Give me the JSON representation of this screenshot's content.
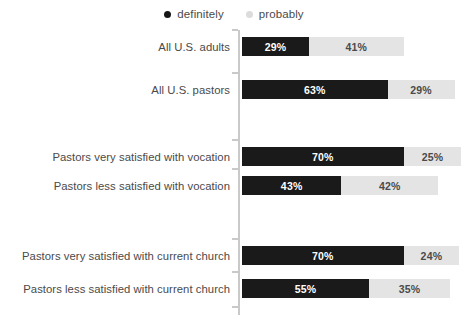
{
  "chart_data": {
    "type": "bar",
    "title": "",
    "subtitle": "",
    "xlabel": "",
    "ylabel": "",
    "orientation": "horizontal",
    "stacked": true,
    "grid": false,
    "legend_position": "top-center",
    "xlim": [
      0,
      100
    ],
    "value_suffix": "%",
    "categories": [
      "All U.S. adults",
      "All U.S. pastors",
      "Pastors very satisfied with vocation",
      "Pastors less satisfied with vocation",
      "Pastors very satisfied with current church",
      "Pastors less satisfied with current church"
    ],
    "groups": [
      [
        0,
        1
      ],
      [
        2,
        3
      ],
      [
        4,
        5
      ]
    ],
    "series": [
      {
        "name": "definitely",
        "color": "#1a1a1a",
        "values": [
          29,
          63,
          70,
          43,
          70,
          55
        ]
      },
      {
        "name": "probably",
        "color": "#e4e4e4",
        "values": [
          41,
          29,
          25,
          42,
          24,
          35
        ]
      }
    ],
    "labels": [
      {
        "definitely": "29%",
        "probably": "41%"
      },
      {
        "definitely": "63%",
        "probably": "29%"
      },
      {
        "definitely": "70%",
        "probably": "25%"
      },
      {
        "definitely": "43%",
        "probably": "42%"
      },
      {
        "definitely": "70%",
        "probably": "24%"
      },
      {
        "definitely": "55%",
        "probably": "35%"
      }
    ]
  },
  "legend": {
    "items": [
      {
        "label": "definitely",
        "color": "#1a1a1a",
        "key": "definitely"
      },
      {
        "label": "probably",
        "color": "#dcdcdc",
        "key": "probably"
      }
    ]
  }
}
